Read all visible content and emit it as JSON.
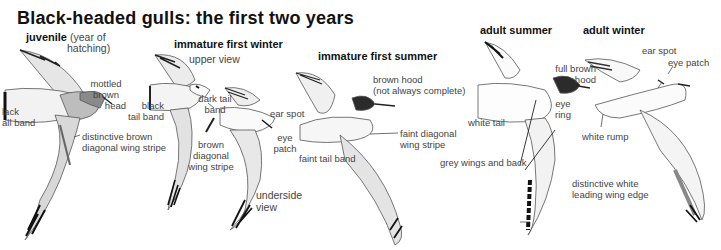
{
  "title": "Black-headed gulls: the first two years",
  "sections": {
    "juvenile": {
      "heading": "juvenile",
      "sub1": "(year of",
      "sub2": "hatching)",
      "labels": {
        "head1": "mottled",
        "head2": "brown",
        "head3": "head",
        "tail1": "lack",
        "tail2": "ail band",
        "stripe1": "distinctive brown",
        "stripe2": "diagonal wing stripe"
      }
    },
    "immature_first_winter": {
      "heading": "immature first winter",
      "labels": {
        "upper": "upper view",
        "tail1": "black",
        "tail2": "tail band",
        "dark1": "dark tail",
        "dark2": "band",
        "stripe1": "brown",
        "stripe2": "diagonal",
        "stripe3": "wing stripe",
        "ear": "ear spot",
        "eye1": "eye",
        "eye2": "patch",
        "under1": "underside",
        "under2": "view"
      }
    },
    "immature_first_summer": {
      "heading": "immature first summer",
      "labels": {
        "hood1": "brown hood",
        "hood2": "(not always complete)",
        "stripe1": "faint diagonal",
        "stripe2": "wing stripe",
        "tail": "faint tail band"
      }
    },
    "adult_summer": {
      "heading": "adult summer",
      "labels": {
        "hood1": "full brown",
        "hood2": "hood",
        "eye1": "eye",
        "eye2": "ring",
        "tail": "white tail",
        "grey": "grey wings and back",
        "edge1": "distinctive white",
        "edge2": "leading wing edge"
      }
    },
    "adult_winter": {
      "heading": "adult winter",
      "labels": {
        "ear": "ear spot",
        "eye": "eye patch",
        "rump": "white rump"
      }
    }
  },
  "colors": {
    "ink": "#111111",
    "label": "#444444",
    "wingtip": "#1a1a1a",
    "hood": "#2b2b2b",
    "grey": "#9a9a9a"
  }
}
